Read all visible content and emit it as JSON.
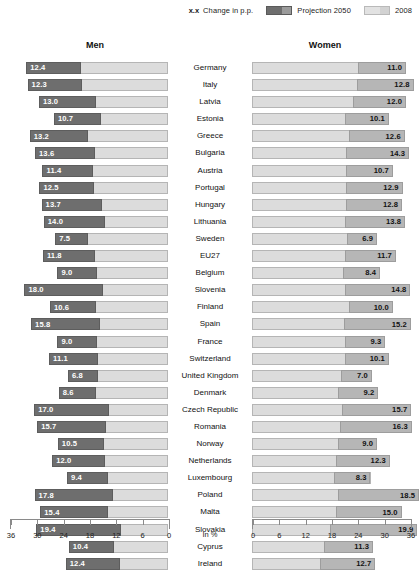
{
  "legend": {
    "change_marker": "x.x",
    "change_label": "Change in p.p.",
    "series": [
      {
        "name": "Projection 2050",
        "color": "#6e6e6e"
      },
      {
        "name": "2008",
        "color": "#dcdcdc"
      }
    ]
  },
  "headers": {
    "left": "Men",
    "right": "Women"
  },
  "axis": {
    "unit": "In %",
    "left_ticks": [
      "36",
      "30",
      "24",
      "18",
      "12",
      "6",
      "0"
    ],
    "right_ticks": [
      "0",
      "6",
      "12",
      "18",
      "24",
      "30",
      "36"
    ]
  },
  "chart_data": {
    "type": "bar",
    "subtype": "back-to-back population pyramid bar chart",
    "xlabel": "In %",
    "ylabel": "",
    "xlim_left": [
      36,
      0
    ],
    "xlim_right": [
      0,
      36
    ],
    "grid": false,
    "legend_position": "top-right",
    "categories": [
      "Germany",
      "Italy",
      "Latvia",
      "Estonia",
      "Greece",
      "Bulgaria",
      "Austria",
      "Portugal",
      "Hungary",
      "Lithuania",
      "Sweden",
      "EU27",
      "Belgium",
      "Slovenia",
      "Finland",
      "Spain",
      "France",
      "Switzerland",
      "United Kingdom",
      "Denmark",
      "Czech Republic",
      "Romania",
      "Norway",
      "Netherlands",
      "Luxembourg",
      "Poland",
      "Malta",
      "Slovakia",
      "Cyprus",
      "Ireland"
    ],
    "series": [
      {
        "name": "Men — Change in p.p. (Projection 2050)",
        "side": "left",
        "values": [
          12.4,
          12.3,
          13.0,
          10.7,
          13.2,
          13.6,
          11.4,
          12.5,
          13.7,
          14.0,
          7.5,
          11.8,
          9.0,
          18.0,
          10.6,
          15.8,
          9.0,
          11.1,
          6.8,
          8.6,
          17.0,
          15.7,
          10.5,
          12.0,
          9.4,
          17.8,
          15.4,
          19.4,
          10.4,
          12.4
        ]
      },
      {
        "name": "Men — 2008 base",
        "side": "left",
        "values": [
          19.9,
          19.7,
          16.4,
          15.3,
          18.3,
          16.7,
          17.2,
          16.8,
          15.1,
          14.3,
          18.2,
          16.7,
          16.2,
          14.7,
          16.3,
          15.4,
          16.2,
          16.0,
          16.0,
          16.3,
          13.5,
          14.1,
          14.6,
          14.4,
          13.6,
          12.6,
          13.7,
          10.6,
          12.2,
          10.9
        ]
      },
      {
        "name": "Women — Change in p.p. (Projection 2050)",
        "side": "right",
        "values": [
          11.0,
          12.8,
          12.0,
          10.1,
          12.6,
          14.3,
          10.7,
          12.9,
          12.8,
          13.8,
          6.9,
          11.7,
          8.4,
          14.8,
          10.0,
          15.2,
          9.3,
          10.1,
          7.0,
          9.2,
          15.7,
          16.3,
          9.0,
          12.3,
          8.3,
          18.5,
          15.0,
          19.9,
          11.3,
          12.7
        ]
      },
      {
        "name": "Women — 2008 base",
        "side": "right",
        "values": [
          24.1,
          24.0,
          23.1,
          21.1,
          22.2,
          21.5,
          21.4,
          21.4,
          21.4,
          21.1,
          21.6,
          21.1,
          20.8,
          21.3,
          22.1,
          21.0,
          21.1,
          21.1,
          20.3,
          19.6,
          20.6,
          20.1,
          19.5,
          19.1,
          18.7,
          19.6,
          19.1,
          17.8,
          16.3,
          15.4
        ]
      }
    ],
    "rows": [
      {
        "country": "Germany",
        "men_change": 12.4,
        "men_2008": 19.9,
        "women_change": 11.0,
        "women_2008": 24.1
      },
      {
        "country": "Italy",
        "men_change": 12.3,
        "men_2008": 19.7,
        "women_change": 12.8,
        "women_2008": 24.0
      },
      {
        "country": "Latvia",
        "men_change": 13.0,
        "men_2008": 16.4,
        "women_change": 12.0,
        "women_2008": 23.1
      },
      {
        "country": "Estonia",
        "men_change": 10.7,
        "men_2008": 15.3,
        "women_change": 10.1,
        "women_2008": 21.1
      },
      {
        "country": "Greece",
        "men_change": 13.2,
        "men_2008": 18.3,
        "women_change": 12.6,
        "women_2008": 22.2
      },
      {
        "country": "Bulgaria",
        "men_change": 13.6,
        "men_2008": 16.7,
        "women_change": 14.3,
        "women_2008": 21.5
      },
      {
        "country": "Austria",
        "men_change": 11.4,
        "men_2008": 17.2,
        "women_change": 10.7,
        "women_2008": 21.4
      },
      {
        "country": "Portugal",
        "men_change": 12.5,
        "men_2008": 16.8,
        "women_change": 12.9,
        "women_2008": 21.4
      },
      {
        "country": "Hungary",
        "men_change": 13.7,
        "men_2008": 15.1,
        "women_change": 12.8,
        "women_2008": 21.4
      },
      {
        "country": "Lithuania",
        "men_change": 14.0,
        "men_2008": 14.3,
        "women_change": 13.8,
        "women_2008": 21.1
      },
      {
        "country": "Sweden",
        "men_change": 7.5,
        "men_2008": 18.2,
        "women_change": 6.9,
        "women_2008": 21.6
      },
      {
        "country": "EU27",
        "men_change": 11.8,
        "men_2008": 16.7,
        "women_change": 11.7,
        "women_2008": 21.1
      },
      {
        "country": "Belgium",
        "men_change": 9.0,
        "men_2008": 16.2,
        "women_change": 8.4,
        "women_2008": 20.8
      },
      {
        "country": "Slovenia",
        "men_change": 18.0,
        "men_2008": 14.7,
        "women_change": 14.8,
        "women_2008": 21.3
      },
      {
        "country": "Finland",
        "men_change": 10.6,
        "men_2008": 16.3,
        "women_change": 10.0,
        "women_2008": 22.1
      },
      {
        "country": "Spain",
        "men_change": 15.8,
        "men_2008": 15.4,
        "women_change": 15.2,
        "women_2008": 21.0
      },
      {
        "country": "France",
        "men_change": 9.0,
        "men_2008": 16.2,
        "women_change": 9.3,
        "women_2008": 21.1
      },
      {
        "country": "Switzerland",
        "men_change": 11.1,
        "men_2008": 16.0,
        "women_change": 10.1,
        "women_2008": 21.1
      },
      {
        "country": "United Kingdom",
        "men_change": 6.8,
        "men_2008": 16.0,
        "women_change": 7.0,
        "women_2008": 20.3
      },
      {
        "country": "Denmark",
        "men_change": 8.6,
        "men_2008": 16.3,
        "women_change": 9.2,
        "women_2008": 19.6
      },
      {
        "country": "Czech Republic",
        "men_change": 17.0,
        "men_2008": 13.5,
        "women_change": 15.7,
        "women_2008": 20.6
      },
      {
        "country": "Romania",
        "men_change": 15.7,
        "men_2008": 14.1,
        "women_change": 16.3,
        "women_2008": 20.1
      },
      {
        "country": "Norway",
        "men_change": 10.5,
        "men_2008": 14.6,
        "women_change": 9.0,
        "women_2008": 19.5
      },
      {
        "country": "Netherlands",
        "men_change": 12.0,
        "men_2008": 14.4,
        "women_change": 12.3,
        "women_2008": 19.1
      },
      {
        "country": "Luxembourg",
        "men_change": 9.4,
        "men_2008": 13.6,
        "women_change": 8.3,
        "women_2008": 18.7
      },
      {
        "country": "Poland",
        "men_change": 17.8,
        "men_2008": 12.6,
        "women_change": 18.5,
        "women_2008": 19.6
      },
      {
        "country": "Malta",
        "men_change": 15.4,
        "men_2008": 13.7,
        "women_change": 15.0,
        "women_2008": 19.1
      },
      {
        "country": "Slovakia",
        "men_change": 19.4,
        "men_2008": 10.6,
        "women_change": 19.9,
        "women_2008": 17.8
      },
      {
        "country": "Cyprus",
        "men_change": 10.4,
        "men_2008": 12.2,
        "women_change": 11.3,
        "women_2008": 16.3
      },
      {
        "country": "Ireland",
        "men_change": 12.4,
        "men_2008": 10.9,
        "women_change": 12.7,
        "women_2008": 15.4
      }
    ]
  }
}
